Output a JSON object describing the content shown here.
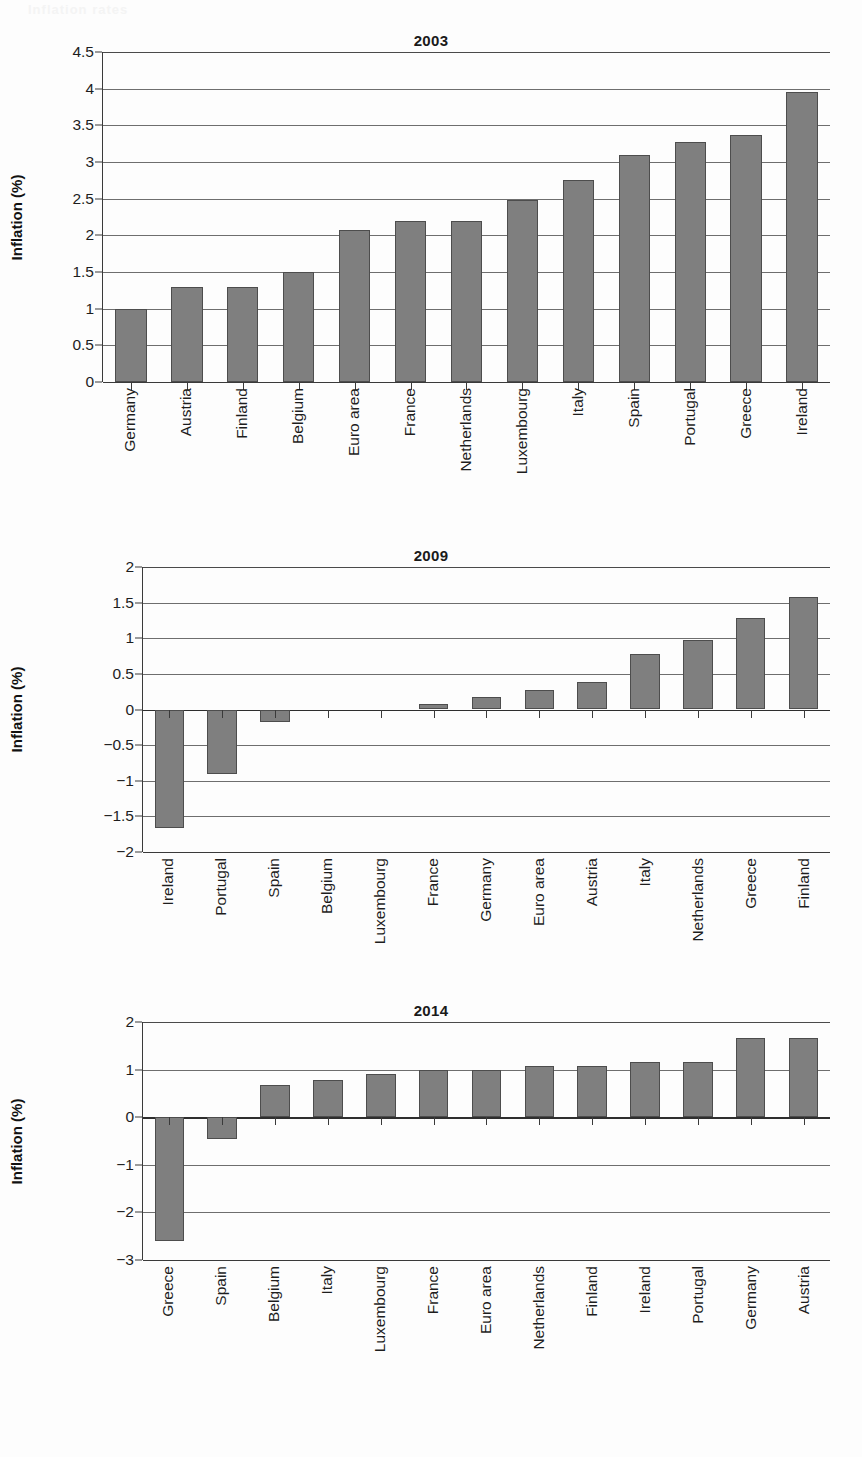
{
  "page": {
    "ghost_text": "Inflation rates"
  },
  "axis_title": "Inflation (%)",
  "colors": {
    "bar_fill": "#7f7f7f",
    "bar_stroke": "#4d4d4d",
    "gridline": "#6e6e6e",
    "axis": "#3a3a3a",
    "text": "#1d1d1d"
  },
  "chart_data": [
    {
      "type": "bar",
      "title": "2003",
      "xlabel": "",
      "ylabel": "Inflation (%)",
      "ylim": [
        0,
        4.5
      ],
      "ystep": 0.5,
      "grid": true,
      "legend": "none",
      "yticks": [
        "0",
        "0.5",
        "1",
        "1.5",
        "2",
        "2.5",
        "3",
        "3.5",
        "4",
        "4.5"
      ],
      "ytick_values": [
        0,
        0.5,
        1,
        1.5,
        2,
        2.5,
        3,
        3.5,
        4,
        4.5
      ],
      "categories": [
        "Germany",
        "Austria",
        "Finland",
        "Belgium",
        "Euro area",
        "France",
        "Netherlands",
        "Luxembourg",
        "Italy",
        "Spain",
        "Portugal",
        "Greece",
        "Ireland"
      ],
      "values": [
        1.0,
        1.3,
        1.3,
        1.5,
        2.07,
        2.2,
        2.2,
        2.48,
        2.76,
        3.09,
        3.27,
        3.37,
        3.96
      ]
    },
    {
      "type": "bar",
      "title": "2009",
      "xlabel": "",
      "ylabel": "Inflation (%)",
      "ylim": [
        -2,
        2
      ],
      "ystep": 0.5,
      "grid": true,
      "legend": "none",
      "yticks": [
        "-2",
        "-1.5",
        "-1",
        "-0.5",
        "0",
        "0.5",
        "1",
        "1.5",
        "2"
      ],
      "ytick_values": [
        -2,
        -1.5,
        -1,
        -0.5,
        0,
        0.5,
        1,
        1.5,
        2
      ],
      "categories": [
        "Ireland",
        "Portugal",
        "Spain",
        "Belgium",
        "Luxembourg",
        "France",
        "Germany",
        "Euro area",
        "Austria",
        "Italy",
        "Netherlands",
        "Greece",
        "Finland"
      ],
      "values": [
        -1.66,
        -0.9,
        -0.17,
        0.0,
        0.0,
        0.08,
        0.18,
        0.28,
        0.38,
        0.78,
        0.98,
        1.28,
        1.58
      ]
    },
    {
      "type": "bar",
      "title": "2014",
      "xlabel": "",
      "ylabel": "Inflation (%)",
      "ylim": [
        -3,
        2
      ],
      "ystep": 1,
      "grid": true,
      "legend": "none",
      "yticks": [
        "-3",
        "-2",
        "-1",
        "0",
        "1",
        "2"
      ],
      "ytick_values": [
        -3,
        -2,
        -1,
        0,
        1,
        2
      ],
      "categories": [
        "Greece",
        "Spain",
        "Belgium",
        "Italy",
        "Luxembourg",
        "France",
        "Euro area",
        "Netherlands",
        "Finland",
        "Ireland",
        "Portugal",
        "Germany",
        "Austria"
      ],
      "values": [
        -2.6,
        -0.45,
        0.68,
        0.78,
        0.9,
        1.0,
        1.0,
        1.08,
        1.07,
        1.15,
        1.15,
        1.66,
        1.66
      ]
    }
  ]
}
